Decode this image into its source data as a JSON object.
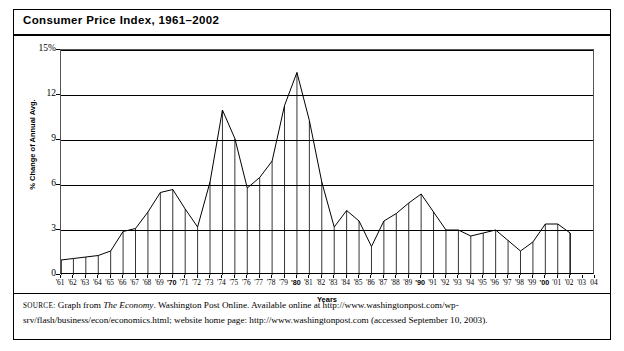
{
  "title": "Consumer Price Index, 1961–2002",
  "axes": {
    "ylabel": "% Change of Annual Avg.",
    "xlabel": "Years",
    "yticks": [
      "15%",
      "12",
      "9",
      "6",
      "3",
      "0"
    ],
    "ytick_values": [
      15,
      12,
      9,
      6,
      3,
      0
    ]
  },
  "source": {
    "prefix": "SOURCE:",
    "part1": " Graph from ",
    "italic": "The Economy",
    "part2": ". Washington Post Online. Available online at http://www.washingtonpost.com/wp-srv/flash/business/econ/economics.html; website home page: http://www.washingtonpost.com (accessed September 10, 2003)."
  },
  "chart_data": {
    "type": "area",
    "title": "Consumer Price Index, 1961–2002",
    "xlabel": "Years",
    "ylabel": "% Change of Annual Avg.",
    "ylim": [
      0,
      15
    ],
    "xlim": [
      "'61",
      "'04"
    ],
    "grid": true,
    "legend": "none",
    "axis_tick_labels": [
      "'61",
      "'62",
      "'63",
      "'64",
      "'65",
      "'66",
      "'67",
      "'68",
      "'69",
      "'70",
      "'71",
      "'72",
      "'73",
      "'74",
      "'75",
      "'76",
      "'77",
      "'78",
      "'79",
      "'80",
      "'81",
      "'82",
      "'83",
      "'84",
      "'85",
      "'86",
      "'87",
      "'88",
      "'89",
      "'90",
      "'91",
      "'92",
      "'93",
      "'94",
      "'95",
      "'96",
      "'97",
      "'98",
      "'99",
      "'00",
      "'01",
      "'02",
      "'03",
      "04"
    ],
    "bold_tick_labels": [
      "'70",
      "'80",
      "'90",
      "'00"
    ],
    "categories": [
      "'61",
      "'62",
      "'63",
      "'64",
      "'65",
      "'66",
      "'67",
      "'68",
      "'69",
      "'70",
      "'71",
      "'72",
      "'73",
      "'74",
      "'75",
      "'76",
      "'77",
      "'78",
      "'79",
      "'80",
      "'81",
      "'82",
      "'83",
      "'84",
      "'85",
      "'86",
      "'87",
      "'88",
      "'89",
      "'90",
      "'91",
      "'92",
      "'93",
      "'94",
      "'95",
      "'96",
      "'97",
      "'98",
      "'99",
      "'00",
      "'01",
      "'02"
    ],
    "values": [
      1.0,
      1.1,
      1.2,
      1.3,
      1.6,
      2.9,
      3.1,
      4.2,
      5.5,
      5.7,
      4.4,
      3.2,
      6.2,
      11.0,
      9.1,
      5.8,
      6.5,
      7.6,
      11.3,
      13.5,
      10.3,
      6.2,
      3.2,
      4.3,
      3.6,
      1.9,
      3.6,
      4.1,
      4.8,
      5.4,
      4.2,
      3.0,
      3.0,
      2.6,
      2.8,
      3.0,
      2.3,
      1.6,
      2.2,
      3.4,
      3.4,
      2.8
    ],
    "series": [
      {
        "name": "% Change of Annual Avg.",
        "values": [
          1.0,
          1.1,
          1.2,
          1.3,
          1.6,
          2.9,
          3.1,
          4.2,
          5.5,
          5.7,
          4.4,
          3.2,
          6.2,
          11.0,
          9.1,
          5.8,
          6.5,
          7.6,
          11.3,
          13.5,
          10.3,
          6.2,
          3.2,
          4.3,
          3.6,
          1.9,
          3.6,
          4.1,
          4.8,
          5.4,
          4.2,
          3.0,
          3.0,
          2.6,
          2.8,
          3.0,
          2.3,
          1.6,
          2.2,
          3.4,
          3.4,
          2.8
        ]
      }
    ]
  }
}
